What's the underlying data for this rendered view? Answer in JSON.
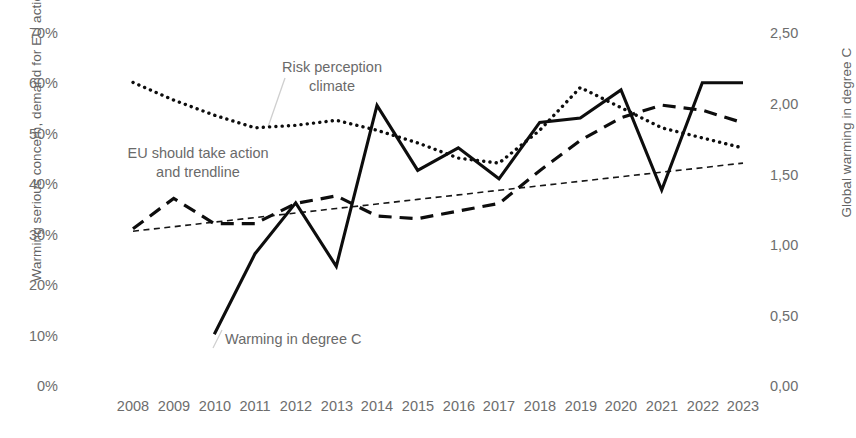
{
  "chart_data": {
    "type": "line",
    "title": "",
    "xlabel": "",
    "categories": [
      2008,
      2009,
      2010,
      2011,
      2012,
      2013,
      2014,
      2015,
      2016,
      2017,
      2018,
      2019,
      2020,
      2021,
      2022,
      2023
    ],
    "axes": {
      "left": {
        "label": "Warming serious concern, demand for EU action in %",
        "ticks": [
          "0%",
          "10%",
          "20%",
          "30%",
          "40%",
          "50%",
          "60%",
          "70%"
        ],
        "tick_values": [
          0,
          10,
          20,
          30,
          40,
          50,
          60,
          70
        ],
        "lim": [
          0,
          70
        ],
        "unit": "%"
      },
      "right": {
        "label": "Global warming in degree C",
        "ticks": [
          "0,00",
          "0,50",
          "1,00",
          "1,50",
          "2,00",
          "2,50"
        ],
        "tick_values": [
          0.0,
          0.5,
          1.0,
          1.5,
          2.0,
          2.5
        ],
        "lim": [
          0.0,
          2.5
        ],
        "unit": "degree C"
      }
    },
    "grid": false,
    "legend_position": "inline-annotations",
    "series": [
      {
        "name": "Risk perception climate",
        "axis": "left",
        "style": "dotted",
        "color": "#0d0d0d",
        "values": [
          60.0,
          56.5,
          53.5,
          51.0,
          51.5,
          52.5,
          50.5,
          48.0,
          45.0,
          44.0,
          50.5,
          59.0,
          55.0,
          51.0,
          49.0,
          47.0
        ]
      },
      {
        "name": "EU should take action",
        "axis": "left",
        "style": "dashed",
        "color": "#0d0d0d",
        "values": [
          31.0,
          37.0,
          32.0,
          32.0,
          36.0,
          37.5,
          33.5,
          33.0,
          34.5,
          36.0,
          42.5,
          48.5,
          53.0,
          55.5,
          54.5,
          52.0
        ]
      },
      {
        "name": "Trendline (EU should take action)",
        "axis": "left",
        "style": "thin-dashed",
        "color": "#161616",
        "values": [
          30.5,
          31.4,
          32.3,
          33.2,
          34.1,
          35.0,
          35.9,
          36.8,
          37.7,
          38.6,
          39.5,
          40.4,
          41.3,
          42.2,
          43.1,
          44.0
        ]
      },
      {
        "name": "Warming in degree C",
        "axis": "right",
        "style": "solid",
        "color": "#0d0d0d",
        "values": [
          null,
          null,
          0.36,
          0.93,
          1.29,
          0.84,
          1.98,
          1.52,
          1.68,
          1.46,
          1.86,
          1.89,
          2.09,
          1.38,
          2.14,
          2.14
        ],
        "left_axis_equivalent": [
          null,
          null,
          10.0,
          26.0,
          36.0,
          23.5,
          55.5,
          42.5,
          47.0,
          41.0,
          52.0,
          53.0,
          58.5,
          38.5,
          60.0,
          60.0
        ],
        "starts_at": 2010
      }
    ],
    "annotations": [
      {
        "name": "risk-perception-label",
        "text": "Risk perception\nclimate",
        "leader": true
      },
      {
        "name": "eu-action-label",
        "text": "EU should take action\nand trendline",
        "leader": false
      },
      {
        "name": "warming-label",
        "text": "Warming in degree C",
        "leader": true
      }
    ]
  }
}
